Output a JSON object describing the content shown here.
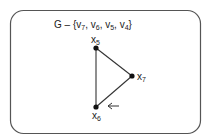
{
  "diagram": {
    "title": {
      "prefix": "G – {",
      "vertices_removed": [
        "v7",
        "v6",
        "v5",
        "v4"
      ],
      "suffix": "}"
    },
    "nodes": [
      {
        "id": "x5",
        "base": "x",
        "sub": "5"
      },
      {
        "id": "x7",
        "base": "x",
        "sub": "7"
      },
      {
        "id": "x6",
        "base": "x",
        "sub": "6"
      }
    ],
    "edges": [
      {
        "from": "x5",
        "to": "x7"
      },
      {
        "from": "x7",
        "to": "x6"
      },
      {
        "from": "x6",
        "to": "x5"
      }
    ],
    "annotation": {
      "type": "arrow",
      "direction": "left",
      "points_to": "edge x7-x6 near x6"
    },
    "colors": {
      "stroke": "#333333",
      "node": "#111111",
      "border": "#555555"
    }
  }
}
